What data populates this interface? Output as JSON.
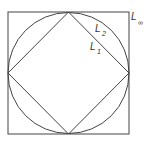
{
  "diagram": {
    "stroke_color": "#444444",
    "background": "#ffffff",
    "shapes": {
      "square": {
        "name": "L-infinity unit ball",
        "x": 8,
        "y": 12,
        "width": 121,
        "height": 122
      },
      "circle": {
        "name": "L2 unit ball",
        "cx": 68.5,
        "cy": 73,
        "r": 60.5
      },
      "diamond": {
        "name": "L1 unit ball",
        "points": "68.5,12 129,73 68.5,134 8,73"
      }
    },
    "labels": {
      "l_inf": {
        "main": "L",
        "sub": "∞"
      },
      "l2": {
        "main": "L",
        "sub": "2"
      },
      "l1": {
        "main": "L",
        "sub": "1"
      }
    }
  }
}
